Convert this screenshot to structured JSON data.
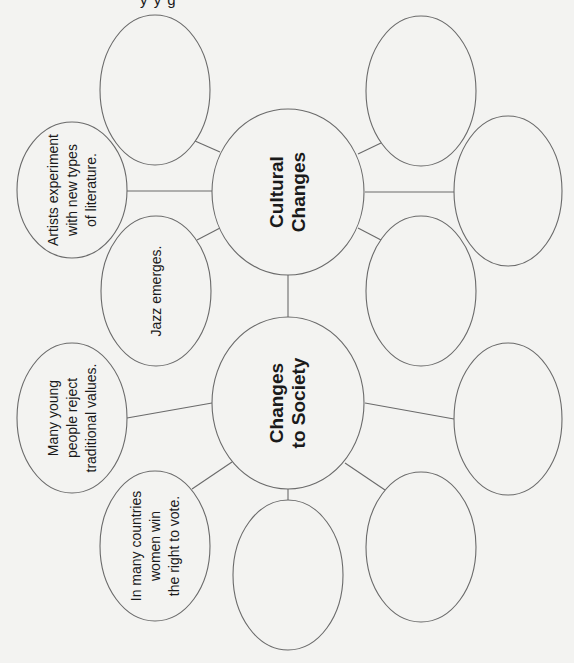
{
  "header": {
    "cutoff_title": "y  y g"
  },
  "colors": {
    "background": "#f3f3f1",
    "stroke": "#6a6a6a",
    "text": "#1a1a1a"
  },
  "diagram": {
    "orientation": "rotated -90deg (text reads bottom-to-top)",
    "center_nodes": [
      {
        "id": "cultural",
        "label": "Cultural\nChanges",
        "cx": 288,
        "cy": 192,
        "rx": 76,
        "ry": 83
      },
      {
        "id": "society",
        "label": "Changes\nto Society",
        "cx": 288,
        "cy": 403,
        "rx": 76,
        "ry": 86
      }
    ],
    "cultural_branches": [
      {
        "id": "c1",
        "label": "",
        "cx": 155,
        "cy": 90,
        "rx": 55,
        "ry": 75
      },
      {
        "id": "c2",
        "label": "Artists experiment\nwith new types\nof literature.",
        "cx": 72,
        "cy": 190,
        "rx": 55,
        "ry": 68
      },
      {
        "id": "c3",
        "label": "Jazz emerges.",
        "cx": 156,
        "cy": 291,
        "rx": 55,
        "ry": 75
      },
      {
        "id": "c4",
        "label": "",
        "cx": 421,
        "cy": 91,
        "rx": 55,
        "ry": 75
      },
      {
        "id": "c5",
        "label": "",
        "cx": 508,
        "cy": 191,
        "rx": 54,
        "ry": 75
      },
      {
        "id": "c6",
        "label": "",
        "cx": 421,
        "cy": 291,
        "rx": 55,
        "ry": 75
      }
    ],
    "society_branches": [
      {
        "id": "s1",
        "label": "Many young\npeople reject\ntraditional values.",
        "cx": 72,
        "cy": 418,
        "rx": 55,
        "ry": 75
      },
      {
        "id": "s2",
        "label": "In many countries\nwomen win\nthe right to vote.",
        "cx": 155,
        "cy": 546,
        "rx": 55,
        "ry": 75
      },
      {
        "id": "s3",
        "label": "",
        "cx": 288,
        "cy": 575,
        "rx": 55,
        "ry": 75
      },
      {
        "id": "s4",
        "label": "",
        "cx": 421,
        "cy": 547,
        "rx": 55,
        "ry": 75
      },
      {
        "id": "s5",
        "label": "",
        "cx": 508,
        "cy": 419,
        "rx": 54,
        "ry": 76
      }
    ],
    "connectors": [
      {
        "x1": 220,
        "y1": 152,
        "x2": 195,
        "y2": 141
      },
      {
        "x1": 212,
        "y1": 191,
        "x2": 127,
        "y2": 191
      },
      {
        "x1": 220,
        "y1": 228,
        "x2": 197,
        "y2": 240
      },
      {
        "x1": 358,
        "y1": 154,
        "x2": 381,
        "y2": 143
      },
      {
        "x1": 365,
        "y1": 192,
        "x2": 454,
        "y2": 192
      },
      {
        "x1": 358,
        "y1": 228,
        "x2": 381,
        "y2": 240
      },
      {
        "x1": 288,
        "y1": 275,
        "x2": 288,
        "y2": 318
      },
      {
        "x1": 212,
        "y1": 403,
        "x2": 127,
        "y2": 418
      },
      {
        "x1": 232,
        "y1": 462,
        "x2": 192,
        "y2": 489
      },
      {
        "x1": 288,
        "y1": 489,
        "x2": 288,
        "y2": 500
      },
      {
        "x1": 345,
        "y1": 463,
        "x2": 385,
        "y2": 490
      },
      {
        "x1": 365,
        "y1": 403,
        "x2": 454,
        "y2": 419
      }
    ]
  }
}
